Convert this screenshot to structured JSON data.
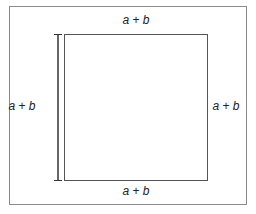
{
  "diagram": {
    "type": "square-with-side-labels",
    "colors": {
      "border": "#7a7a7a",
      "square": "#555555",
      "dimension_line": "#333333",
      "text": "#222222",
      "background": "#ffffff"
    },
    "labels": {
      "top": "a + b",
      "right": "a + b",
      "bottom": "a + b",
      "left": "a + b"
    }
  }
}
